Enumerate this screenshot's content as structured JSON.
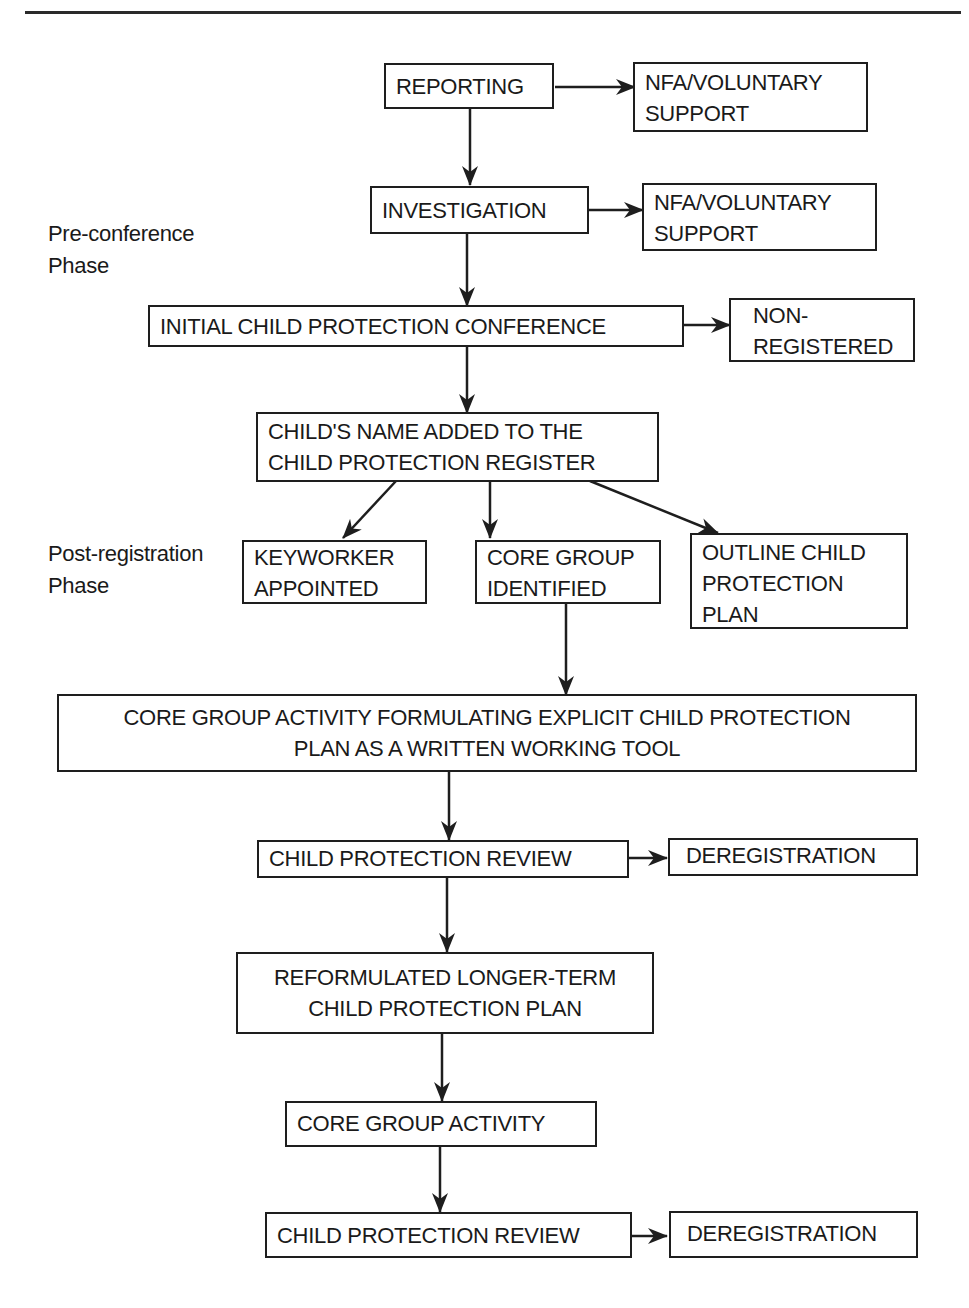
{
  "header": {
    "rule": "running-head-rule"
  },
  "phases": [
    {
      "label": "Pre-conference\nPhase"
    },
    {
      "label": "Post-registration\nPhase"
    }
  ],
  "nodes": {
    "reporting": "REPORTING",
    "nfa1": "NFA/VOLUNTARY\nSUPPORT",
    "investigation": "INVESTIGATION",
    "nfa2": "NFA/VOLUNTARY\nSUPPORT",
    "initial_conference": "INITIAL CHILD PROTECTION CONFERENCE",
    "non_registered": "NON-\nREGISTERED",
    "name_added": "CHILD'S NAME ADDED TO THE\nCHILD PROTECTION REGISTER",
    "keyworker": "KEYWORKER\nAPPOINTED",
    "core_group_identified": "CORE GROUP\nIDENTIFIED",
    "outline_plan": "OUTLINE CHILD\nPROTECTION\nPLAN",
    "core_group_formulating": "CORE GROUP ACTIVITY FORMULATING EXPLICIT CHILD PROTECTION\nPLAN AS A WRITTEN WORKING TOOL",
    "review1": "CHILD PROTECTION REVIEW",
    "dereg1": "DEREGISTRATION",
    "reformulated_plan": "REFORMULATED LONGER-TERM\nCHILD PROTECTION PLAN",
    "core_group_activity": "CORE GROUP ACTIVITY",
    "review2": "CHILD PROTECTION REVIEW",
    "dereg2": "DEREGISTRATION"
  },
  "edges": [
    [
      "reporting",
      "nfa1"
    ],
    [
      "reporting",
      "investigation"
    ],
    [
      "investigation",
      "nfa2"
    ],
    [
      "investigation",
      "initial_conference"
    ],
    [
      "initial_conference",
      "non_registered"
    ],
    [
      "initial_conference",
      "name_added"
    ],
    [
      "name_added",
      "keyworker"
    ],
    [
      "name_added",
      "core_group_identified"
    ],
    [
      "name_added",
      "outline_plan"
    ],
    [
      "core_group_identified",
      "core_group_formulating"
    ],
    [
      "core_group_formulating",
      "review1"
    ],
    [
      "review1",
      "dereg1"
    ],
    [
      "review1",
      "reformulated_plan"
    ],
    [
      "reformulated_plan",
      "core_group_activity"
    ],
    [
      "core_group_activity",
      "review2"
    ],
    [
      "review2",
      "dereg2"
    ]
  ]
}
